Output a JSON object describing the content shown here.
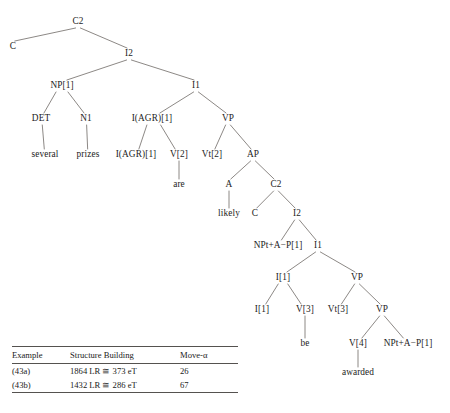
{
  "figure": {
    "type": "syntactic-tree-diagram",
    "line_color": "#6e6a66",
    "text_color": "#1d1d1d"
  },
  "tree": {
    "nodes": [
      {
        "id": "n1",
        "label": "C2",
        "x": 78,
        "y": 22
      },
      {
        "id": "n2",
        "label": "C",
        "x": 13,
        "y": 47
      },
      {
        "id": "n3",
        "label": "I2",
        "x": 129,
        "y": 54
      },
      {
        "id": "n4",
        "label": "NP[1]",
        "x": 62,
        "y": 86
      },
      {
        "id": "n5",
        "label": "I1",
        "x": 196,
        "y": 86
      },
      {
        "id": "n6",
        "label": "DET",
        "x": 41,
        "y": 119
      },
      {
        "id": "n7",
        "label": "N1",
        "x": 86,
        "y": 119
      },
      {
        "id": "n8",
        "label": "I(AGR)[1]",
        "x": 152,
        "y": 119
      },
      {
        "id": "n9",
        "label": "VP",
        "x": 228,
        "y": 119
      },
      {
        "id": "n10",
        "label": "several",
        "x": 45,
        "y": 155
      },
      {
        "id": "n11",
        "label": "prizes",
        "x": 88,
        "y": 155
      },
      {
        "id": "n12",
        "label": "I(AGR)[1]",
        "x": 136,
        "y": 155
      },
      {
        "id": "n13",
        "label": "V[2]",
        "x": 179,
        "y": 155
      },
      {
        "id": "n14",
        "label": "Vt[2]",
        "x": 212,
        "y": 155
      },
      {
        "id": "n15",
        "label": "AP",
        "x": 253,
        "y": 155
      },
      {
        "id": "n16",
        "label": "are",
        "x": 179,
        "y": 185
      },
      {
        "id": "n17",
        "label": "A",
        "x": 229,
        "y": 185
      },
      {
        "id": "n18",
        "label": "C2",
        "x": 276,
        "y": 185
      },
      {
        "id": "n19",
        "label": "likely",
        "x": 229,
        "y": 214
      },
      {
        "id": "n20",
        "label": "C",
        "x": 255,
        "y": 214
      },
      {
        "id": "n21",
        "label": "I2",
        "x": 297,
        "y": 214
      },
      {
        "id": "n22",
        "label": "NPt+A−P[1]",
        "x": 278,
        "y": 246
      },
      {
        "id": "n23",
        "label": "I1",
        "x": 318,
        "y": 246
      },
      {
        "id": "n24",
        "label": "I[1]",
        "x": 283,
        "y": 278
      },
      {
        "id": "n25",
        "label": "VP",
        "x": 357,
        "y": 278
      },
      {
        "id": "n26",
        "label": "I[1]",
        "x": 262,
        "y": 310
      },
      {
        "id": "n27",
        "label": "V[3]",
        "x": 305,
        "y": 310
      },
      {
        "id": "n28",
        "label": "Vt[3]",
        "x": 338,
        "y": 310
      },
      {
        "id": "n29",
        "label": "VP",
        "x": 382,
        "y": 310
      },
      {
        "id": "n30",
        "label": "be",
        "x": 305,
        "y": 344
      },
      {
        "id": "n31",
        "label": "V[4]",
        "x": 358,
        "y": 344
      },
      {
        "id": "n32",
        "label": "NPt+A−P[1]",
        "x": 408,
        "y": 344
      },
      {
        "id": "n33",
        "label": "awarded",
        "x": 358,
        "y": 373
      }
    ],
    "edges": [
      [
        "n1",
        "n2"
      ],
      [
        "n1",
        "n3"
      ],
      [
        "n3",
        "n4"
      ],
      [
        "n3",
        "n5"
      ],
      [
        "n4",
        "n6"
      ],
      [
        "n4",
        "n7"
      ],
      [
        "n5",
        "n8"
      ],
      [
        "n5",
        "n9"
      ],
      [
        "n6",
        "n10"
      ],
      [
        "n7",
        "n11"
      ],
      [
        "n8",
        "n12"
      ],
      [
        "n8",
        "n13"
      ],
      [
        "n9",
        "n14"
      ],
      [
        "n9",
        "n15"
      ],
      [
        "n13",
        "n16"
      ],
      [
        "n15",
        "n17"
      ],
      [
        "n15",
        "n18"
      ],
      [
        "n17",
        "n19"
      ],
      [
        "n18",
        "n20"
      ],
      [
        "n18",
        "n21"
      ],
      [
        "n21",
        "n22"
      ],
      [
        "n21",
        "n23"
      ],
      [
        "n23",
        "n24"
      ],
      [
        "n23",
        "n25"
      ],
      [
        "n24",
        "n26"
      ],
      [
        "n24",
        "n27"
      ],
      [
        "n25",
        "n28"
      ],
      [
        "n25",
        "n29"
      ],
      [
        "n27",
        "n30"
      ],
      [
        "n29",
        "n31"
      ],
      [
        "n29",
        "n32"
      ],
      [
        "n31",
        "n33"
      ]
    ]
  },
  "table": {
    "headers": [
      "Example",
      "Structure Building",
      "Move-α"
    ],
    "rows": [
      [
        "(43a)",
        "1864 LR ≅ 373 eT",
        "26"
      ],
      [
        "(43b)",
        "1432 LR ≅ 286 eT",
        "67"
      ]
    ]
  },
  "caption": {
    "text": ""
  }
}
